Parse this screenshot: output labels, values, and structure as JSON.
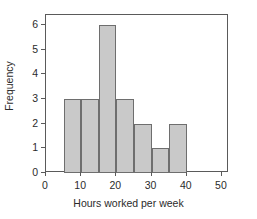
{
  "chart_data": {
    "type": "bar",
    "title": "",
    "subtitle": "",
    "xlabel": "Hours worked per week",
    "ylabel": "Frequency",
    "bin_width": 5,
    "bin_edges": [
      5,
      10,
      15,
      20,
      25,
      30,
      35,
      40
    ],
    "categories": [
      "5-10",
      "10-15",
      "15-20",
      "20-25",
      "25-30",
      "30-35",
      "35-40"
    ],
    "values": [
      3,
      3,
      6,
      3,
      2,
      1,
      2
    ],
    "xlim": [
      0,
      52
    ],
    "ylim": [
      0,
      6.4
    ],
    "xticks": [
      0,
      10,
      20,
      30,
      40,
      50
    ],
    "xtick_labels": [
      "0",
      "10",
      "20",
      "30",
      "40",
      "50"
    ],
    "yticks": [
      0,
      1,
      2,
      3,
      4,
      5,
      6
    ],
    "ytick_labels": [
      "0",
      "1",
      "2",
      "3",
      "4",
      "5",
      "6"
    ],
    "grid": false,
    "legend": null,
    "legend_position": "none",
    "annotations": []
  },
  "style": {
    "bar_fill": "#c9c9c9",
    "bar_edge": "#6e6e6e",
    "axis_color": "#5a5a5a",
    "text_color": "#2b2b2b",
    "background": "#ffffff"
  }
}
